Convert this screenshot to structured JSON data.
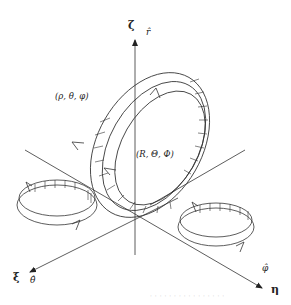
{
  "diagram": {
    "axes": {
      "vertical": {
        "label": "ζ",
        "unit_vector": "r̂"
      },
      "left_front": {
        "label": "ξ",
        "unit_vector": "θ̂"
      },
      "right_front": {
        "label": "η",
        "unit_vector": "φ̂"
      }
    },
    "coordinates": {
      "outer_ring": "(ρ, θ, φ)",
      "inner_ring": "(R, Θ, Φ)"
    },
    "caption": "· ·  · · · · · · ·  · · ·  ·  · · ·"
  },
  "colors": {
    "line": "#333333",
    "background": "#ffffff"
  }
}
